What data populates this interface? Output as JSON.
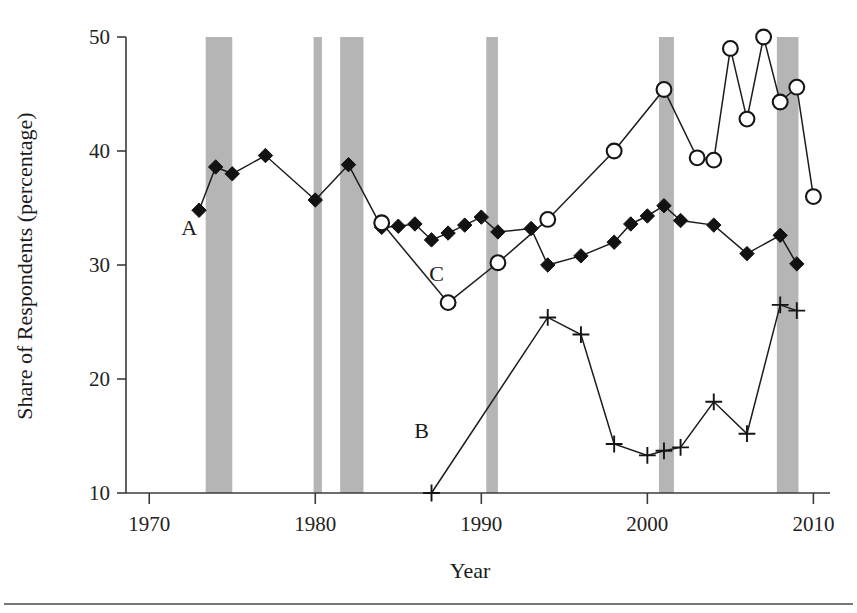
{
  "chart_data": {
    "type": "line",
    "title": "",
    "xlabel": "Year",
    "ylabel": "Share of Respondents (percentage)",
    "xlim": [
      1968.6,
      1011.0
    ],
    "x_axis_min": 1968.6,
    "x_axis_max": 2011.0,
    "ylim": [
      10,
      50
    ],
    "grid": false,
    "legend": "inline-labels",
    "x_ticks": [
      "1970",
      "1980",
      "1990",
      "2000",
      "2010"
    ],
    "x_tick_values": [
      1970,
      1980,
      1990,
      2000,
      2010
    ],
    "y_ticks": [
      "10",
      "20",
      "30",
      "40",
      "50"
    ],
    "y_tick_values": [
      10,
      20,
      30,
      40,
      50
    ],
    "series": [
      {
        "name": "A",
        "label": "A",
        "marker": "filled-diamond",
        "label_x": 1972.4,
        "label_y": 32.6,
        "x": [
          1973,
          1974,
          1975,
          1977,
          1980,
          1982,
          1984,
          1985,
          1986,
          1987,
          1988,
          1989,
          1990,
          1991,
          1993,
          1994,
          1996,
          1998,
          1999,
          2000,
          2001,
          2002,
          2004,
          2006,
          2008,
          2009
        ],
        "values": [
          34.8,
          38.6,
          38.0,
          39.6,
          35.7,
          38.8,
          33.3,
          33.4,
          33.6,
          32.2,
          32.8,
          33.5,
          34.2,
          32.9,
          33.2,
          30.0,
          30.8,
          32.0,
          33.6,
          34.3,
          35.2,
          33.9,
          33.5,
          31.0,
          32.6,
          30.1
        ]
      },
      {
        "name": "B",
        "label": "B",
        "marker": "plus",
        "label_x": 1986.4,
        "label_y": 14.8,
        "x": [
          1987,
          1994,
          1996,
          1998,
          2000,
          2001,
          2002,
          2004,
          2006,
          2008,
          2009
        ],
        "values": [
          10.0,
          25.4,
          23.9,
          14.3,
          13.3,
          13.7,
          14.0,
          18.0,
          15.2,
          26.5,
          26.0
        ]
      },
      {
        "name": "C",
        "label": "C",
        "marker": "open-circle",
        "label_x": 1987.3,
        "label_y": 28.6,
        "x": [
          1984,
          1988,
          1991,
          1994,
          1998,
          2001,
          2003,
          2004,
          2005,
          2006,
          2007,
          2008,
          2009,
          2010
        ],
        "values": [
          33.7,
          26.7,
          30.2,
          34.0,
          40.0,
          45.4,
          39.4,
          39.2,
          49.0,
          42.8,
          50.0,
          44.3,
          45.6,
          36.0
        ]
      }
    ],
    "recession_bands": [
      {
        "start": 1973.4,
        "end": 1975.0
      },
      {
        "start": 1979.9,
        "end": 1980.4
      },
      {
        "start": 1981.5,
        "end": 1982.9
      },
      {
        "start": 1990.3,
        "end": 1991.0
      },
      {
        "start": 2000.7,
        "end": 2001.6
      },
      {
        "start": 2007.8,
        "end": 2009.1
      }
    ],
    "colors": {
      "recession_band": "#a8a8a8",
      "marker": "#121212",
      "line": "#1c1c1c",
      "axis": "#3b3b3b",
      "background": "#ffffff"
    }
  }
}
